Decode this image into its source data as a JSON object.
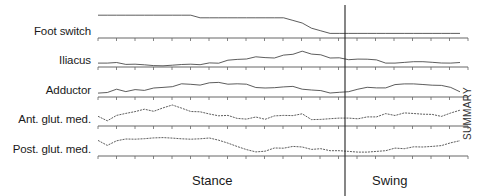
{
  "chart_data": {
    "type": "line",
    "title": "",
    "xlabel": "",
    "phases": [
      "Stance",
      "Swing"
    ],
    "phase_boundary_pct": 62,
    "annotation": "SUMMARY",
    "x_ticks_count": 21,
    "grid": false,
    "series": [
      {
        "name": "Foot switch",
        "values": [
          8,
          8,
          8,
          8,
          8,
          8,
          8,
          8,
          8,
          8,
          8,
          7,
          7,
          7,
          7,
          7,
          7,
          7,
          7,
          7,
          7,
          6,
          5,
          3,
          2,
          1,
          1,
          1,
          1,
          1,
          1,
          1,
          1,
          1,
          1,
          1,
          1,
          1,
          1,
          1
        ]
      },
      {
        "name": "Iliacus",
        "values": [
          1,
          1,
          1,
          0,
          0,
          0,
          0,
          0,
          0,
          0,
          0,
          0,
          1,
          1,
          2,
          2,
          2,
          3,
          3,
          3,
          4,
          4,
          5,
          4,
          4,
          3,
          3,
          2,
          2,
          2,
          2,
          1,
          1,
          1,
          1,
          1,
          1,
          1,
          1,
          1
        ]
      },
      {
        "name": "Adductor",
        "values": [
          1,
          1,
          2,
          1,
          2,
          2,
          3,
          3,
          3,
          4,
          4,
          4,
          5,
          5,
          4,
          4,
          4,
          3,
          3,
          3,
          3,
          3,
          2,
          2,
          2,
          1,
          1,
          1,
          2,
          3,
          3,
          3,
          4,
          4,
          4,
          4,
          4,
          4,
          3,
          1
        ]
      },
      {
        "name": "Ant. glut. med.",
        "values": [
          3,
          1,
          3,
          4,
          5,
          6,
          5,
          6,
          7,
          6,
          5,
          5,
          4,
          3,
          3,
          2,
          2,
          3,
          2,
          3,
          3,
          3,
          4,
          2,
          2,
          2,
          2,
          2,
          2,
          3,
          3,
          4,
          3,
          4,
          4,
          4,
          4,
          3,
          4,
          5
        ]
      },
      {
        "name": "Post. glut. med.",
        "values": [
          5,
          3,
          5,
          6,
          6,
          6,
          6,
          6,
          6,
          6,
          6,
          6,
          6,
          5,
          4,
          3,
          2,
          1,
          1,
          2,
          2,
          3,
          3,
          2,
          2,
          1,
          1,
          1,
          1,
          1,
          1,
          1,
          2,
          2,
          3,
          3,
          3,
          3,
          4,
          5
        ]
      }
    ]
  },
  "labels": {
    "series": [
      "Foot switch",
      "Iliacus",
      "Adductor",
      "Ant. glut. med.",
      "Post. glut. med."
    ],
    "stance": "Stance",
    "swing": "Swing",
    "summary": "SUMMARY"
  }
}
